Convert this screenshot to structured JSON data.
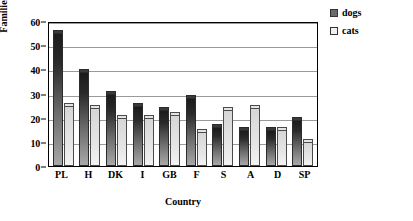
{
  "chart_data": {
    "type": "bar",
    "title": "",
    "xlabel": "Country",
    "ylabel": "Families [%]",
    "categories": [
      "PL",
      "H",
      "DK",
      "I",
      "GB",
      "F",
      "S",
      "A",
      "D",
      "SP"
    ],
    "series": [
      {
        "name": "dogs",
        "color": "#3a3a3a",
        "values": [
          55,
          39,
          30,
          25,
          23,
          28,
          16,
          15,
          15,
          19
        ]
      },
      {
        "name": "cats",
        "color": "#e8e8e8",
        "values": [
          25,
          24,
          20,
          20,
          21,
          14,
          23,
          24,
          15,
          10
        ]
      }
    ],
    "ylim": [
      0,
      60
    ],
    "yticks": [
      0,
      10,
      20,
      30,
      40,
      50,
      60
    ],
    "grid": true,
    "legend_position": "top-right"
  },
  "legend": {
    "items": [
      {
        "label": "dogs"
      },
      {
        "label": "cats"
      }
    ]
  }
}
